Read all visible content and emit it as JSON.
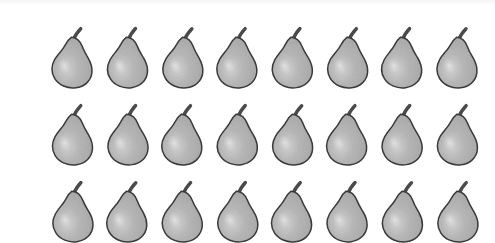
{
  "page": {
    "background_color": "#ffffff",
    "width": 495,
    "height": 243
  },
  "top_band": {
    "name": "scan-edge-band",
    "color": "#f3f3f3"
  },
  "grid": {
    "columns": 8,
    "rows": 3,
    "total_items": 24,
    "first_left": 45,
    "first_top": 22,
    "column_pitch": 55,
    "row_pitch": 77,
    "item_width": 52,
    "item_height": 68
  },
  "pear": {
    "label": "pear",
    "body_color": "#b5b5b5",
    "body_color_dark": "#a4a4a4",
    "highlight_color": "#d2d2d2",
    "outline_color": "#3a3a3a",
    "stem_color": "#4a4a4a",
    "outline_width": 1.5
  },
  "items": [
    {
      "index": 1,
      "row": 1,
      "column": 1,
      "label": "pear"
    },
    {
      "index": 2,
      "row": 1,
      "column": 2,
      "label": "pear"
    },
    {
      "index": 3,
      "row": 1,
      "column": 3,
      "label": "pear"
    },
    {
      "index": 4,
      "row": 1,
      "column": 4,
      "label": "pear"
    },
    {
      "index": 5,
      "row": 1,
      "column": 5,
      "label": "pear"
    },
    {
      "index": 6,
      "row": 1,
      "column": 6,
      "label": "pear"
    },
    {
      "index": 7,
      "row": 1,
      "column": 7,
      "label": "pear"
    },
    {
      "index": 8,
      "row": 1,
      "column": 8,
      "label": "pear"
    },
    {
      "index": 9,
      "row": 2,
      "column": 1,
      "label": "pear"
    },
    {
      "index": 10,
      "row": 2,
      "column": 2,
      "label": "pear"
    },
    {
      "index": 11,
      "row": 2,
      "column": 3,
      "label": "pear"
    },
    {
      "index": 12,
      "row": 2,
      "column": 4,
      "label": "pear"
    },
    {
      "index": 13,
      "row": 2,
      "column": 5,
      "label": "pear"
    },
    {
      "index": 14,
      "row": 2,
      "column": 6,
      "label": "pear"
    },
    {
      "index": 15,
      "row": 2,
      "column": 7,
      "label": "pear"
    },
    {
      "index": 16,
      "row": 2,
      "column": 8,
      "label": "pear"
    },
    {
      "index": 17,
      "row": 3,
      "column": 1,
      "label": "pear"
    },
    {
      "index": 18,
      "row": 3,
      "column": 2,
      "label": "pear"
    },
    {
      "index": 19,
      "row": 3,
      "column": 3,
      "label": "pear"
    },
    {
      "index": 20,
      "row": 3,
      "column": 4,
      "label": "pear"
    },
    {
      "index": 21,
      "row": 3,
      "column": 5,
      "label": "pear"
    },
    {
      "index": 22,
      "row": 3,
      "column": 6,
      "label": "pear"
    },
    {
      "index": 23,
      "row": 3,
      "column": 7,
      "label": "pear"
    },
    {
      "index": 24,
      "row": 3,
      "column": 8,
      "label": "pear"
    }
  ]
}
